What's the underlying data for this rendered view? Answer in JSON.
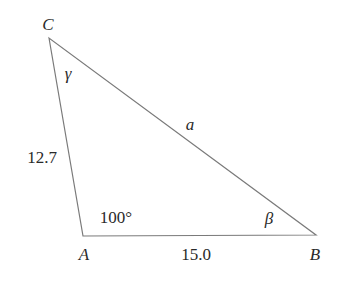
{
  "diagram": {
    "type": "triangle",
    "stroke_color": "#7a7a7a",
    "text_color": "#2a2a2a",
    "vertices": [
      {
        "name": "C",
        "label": "C",
        "x": 49,
        "y": 38
      },
      {
        "name": "A",
        "label": "A",
        "x": 83,
        "y": 236
      },
      {
        "name": "B",
        "label": "B",
        "x": 316,
        "y": 235
      }
    ],
    "sides": {
      "CA": {
        "label": "12.7"
      },
      "AB": {
        "label": "15.0"
      },
      "CB": {
        "label": "a"
      }
    },
    "angles": {
      "A": {
        "label": "100°"
      },
      "B": {
        "label": "β"
      },
      "C": {
        "label": "γ"
      }
    }
  }
}
